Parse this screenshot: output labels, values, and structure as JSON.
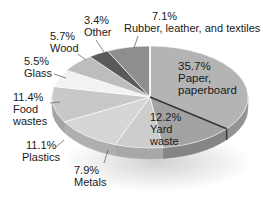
{
  "chart_data": {
    "type": "pie",
    "style": "3d",
    "title": "",
    "unit": "%",
    "categories": [
      "Paper, paperboard",
      "Yard waste",
      "Metals",
      "Plastics",
      "Food wastes",
      "Glass",
      "Wood",
      "Other",
      "Rubber, leather, and textiles"
    ],
    "values": [
      35.7,
      12.2,
      7.9,
      11.1,
      11.4,
      5.5,
      5.7,
      3.4,
      7.1
    ],
    "colors": [
      "#b4b4b4",
      "#a2a2a2",
      "#cdcdcd",
      "#d6d6d6",
      "#c8c8c8",
      "#f2f2f2",
      "#bdbdbd",
      "#5a5a5a",
      "#8e8e8e"
    ],
    "start_angle_deg": -90,
    "direction": "clockwise",
    "legend": "none"
  },
  "labels": [
    {
      "pct": "35.7%",
      "name1": "Paper,",
      "name2": "paperboard"
    },
    {
      "pct": "12.2%",
      "name1": "Yard",
      "name2": "waste"
    },
    {
      "pct": "7.9%",
      "name1": "Metals",
      "name2": ""
    },
    {
      "pct": "11.1%",
      "name1": "Plastics",
      "name2": ""
    },
    {
      "pct": "11.4%",
      "name1": "Food",
      "name2": "wastes"
    },
    {
      "pct": "5.5%",
      "name1": "Glass",
      "name2": ""
    },
    {
      "pct": "5.7%",
      "name1": "Wood",
      "name2": ""
    },
    {
      "pct": "3.4%",
      "name1": "Other",
      "name2": ""
    },
    {
      "pct": "7.1%",
      "name1": "Rubber, leather, and textiles",
      "name2": ""
    }
  ]
}
